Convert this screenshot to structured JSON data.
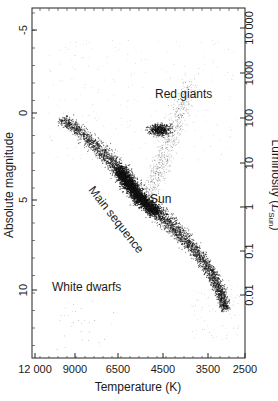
{
  "chart_data": {
    "type": "scatter",
    "title": "",
    "xlabel": "Temperature (K)",
    "ylabel_left": "Absolute magnitude",
    "ylabel_right": "Luminosity (L_Sun)",
    "ylabel_right_main": "Luminosity (",
    "ylabel_right_symbol": "L",
    "ylabel_right_sub": "Sun",
    "ylabel_right_close": ")",
    "x_ticks": [
      {
        "label": "12 000",
        "x": 35
      },
      {
        "label": "9000",
        "x": 75
      },
      {
        "label": "6500",
        "x": 118
      },
      {
        "label": "4500",
        "x": 163
      },
      {
        "label": "3500",
        "x": 208
      },
      {
        "label": "2500",
        "x": 245
      }
    ],
    "y_left_ticks": [
      {
        "label": "-5",
        "y": 30
      },
      {
        "label": "0",
        "y": 113
      },
      {
        "label": "5",
        "y": 200
      },
      {
        "label": "10",
        "y": 290
      }
    ],
    "y_right_ticks": [
      {
        "label": "10 000",
        "y": 28
      },
      {
        "label": "1000",
        "y": 73
      },
      {
        "label": "100",
        "y": 118
      },
      {
        "label": "10",
        "y": 163
      },
      {
        "label": "1",
        "y": 207
      },
      {
        "label": "0.1",
        "y": 251
      },
      {
        "label": "0.01",
        "y": 295
      }
    ],
    "xlim": [
      12000,
      2500
    ],
    "ylim_absolute_magnitude": [
      -6,
      14
    ],
    "ylim_luminosity": [
      10000,
      0.0005
    ],
    "annotations": [
      {
        "text": "Red giants",
        "x": 155,
        "y": 98,
        "rotate": 0
      },
      {
        "text": "Sun",
        "x": 150,
        "y": 203,
        "rotate": 0
      },
      {
        "text": "Main sequence",
        "x": 88,
        "y": 190,
        "rotate": 52
      },
      {
        "text": "White dwarfs",
        "x": 52,
        "y": 291,
        "rotate": 0
      }
    ],
    "regions": [
      {
        "name": "Main sequence",
        "description": "dense diagonal band from ~9000 K, M~0 down to ~3500 K, M~12"
      },
      {
        "name": "Red giants",
        "description": "clump near ~4700 K, M~0 to +1 with a branch up to M~-3"
      },
      {
        "name": "White dwarfs",
        "description": "sparse points at hot temperatures, M~10-13"
      }
    ],
    "sun": {
      "temperature_K": 5800,
      "absolute_magnitude": 4.8,
      "luminosity": 1
    },
    "grid": false,
    "legend": "none"
  }
}
